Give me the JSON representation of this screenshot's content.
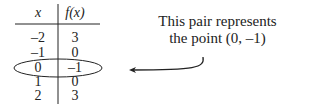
{
  "table": {
    "headers": [
      "x",
      "f(x)"
    ],
    "rows": [
      [
        "–2",
        "3"
      ],
      [
        "–1",
        "0"
      ],
      [
        "0",
        "–1"
      ],
      [
        "1",
        "0"
      ],
      [
        "2",
        "3"
      ]
    ],
    "highlighted_row": 2
  },
  "annotation": {
    "line1": "This pair represents",
    "line2": "the point (0, –1)"
  },
  "colors": {
    "ink": "#222222",
    "background": "#ffffff"
  }
}
